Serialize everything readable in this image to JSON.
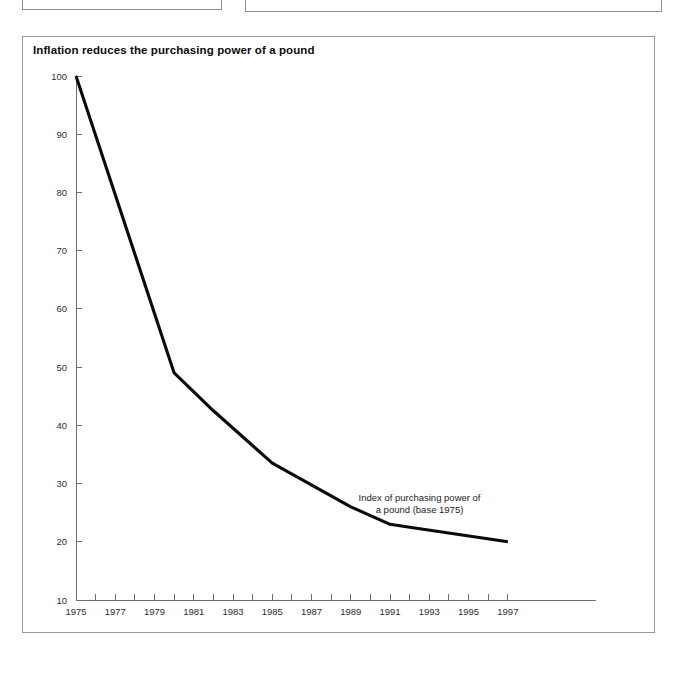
{
  "page": {
    "background_color": "#ffffff",
    "cropped_boxes": [
      {
        "name": "upper-left-panel"
      },
      {
        "name": "upper-right-panel"
      }
    ]
  },
  "figure": {
    "title": "Inflation reduces the purchasing power of a pound",
    "frame_color": "#9a9a9a",
    "line_color": "#0a0a0a",
    "axis_color": "#6e6e6e"
  },
  "chart_data": {
    "type": "line",
    "title": "Inflation reduces the purchasing power of a pound",
    "xlabel": "",
    "ylabel": "",
    "xlim": [
      1975,
      1999
    ],
    "ylim": [
      10,
      100
    ],
    "grid": false,
    "legend_position": "none",
    "annotations": [
      {
        "text_line_1": "Index of purchasing power of",
        "text_line_2": "a pound (base 1975)",
        "x": 1992.5,
        "y": 27
      }
    ],
    "y_ticks": [
      10,
      20,
      30,
      40,
      50,
      60,
      70,
      80,
      90,
      100
    ],
    "y_tick_labels": [
      "10",
      "20",
      "30",
      "40",
      "50",
      "60",
      "70",
      "80",
      "90",
      "100"
    ],
    "x_ticks": [
      1975,
      1976,
      1977,
      1978,
      1979,
      1980,
      1981,
      1982,
      1983,
      1984,
      1985,
      1986,
      1987,
      1988,
      1989,
      1990,
      1991,
      1992,
      1993,
      1994,
      1995,
      1996,
      1997
    ],
    "x_tick_labels_shown": [
      "1975",
      "1977",
      "1979",
      "1981",
      "1983",
      "1985",
      "1987",
      "1989",
      "1991",
      "1993",
      "1995",
      "1997"
    ],
    "series": [
      {
        "name": "Index of purchasing power of a pound (base 1975)",
        "x": [
          1975,
          1980,
          1982,
          1985,
          1989,
          1991,
          1992,
          1997
        ],
        "values": [
          100,
          49,
          42.5,
          33.5,
          26,
          23,
          22.5,
          20
        ]
      }
    ]
  }
}
